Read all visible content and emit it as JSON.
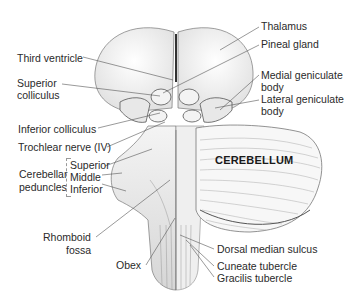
{
  "figure": {
    "region_label": "CEREBELLUM",
    "labels_left": [
      {
        "id": "third-ventricle",
        "text": "Third ventricle"
      },
      {
        "id": "superior-colliculus-1",
        "text": "Superior"
      },
      {
        "id": "superior-colliculus-2",
        "text": "colliculus"
      },
      {
        "id": "inferior-colliculus",
        "text": "Inferior colliculus"
      },
      {
        "id": "trochlear-nerve",
        "text": "Trochlear nerve (IV)"
      },
      {
        "id": "cerebellar-1",
        "text": "Cerebellar"
      },
      {
        "id": "cerebellar-2",
        "text": "peduncles"
      },
      {
        "id": "peduncle-superior",
        "text": "Superior"
      },
      {
        "id": "peduncle-middle",
        "text": "Middle"
      },
      {
        "id": "peduncle-inferior",
        "text": "Inferior"
      },
      {
        "id": "rhomboid-1",
        "text": "Rhomboid"
      },
      {
        "id": "rhomboid-2",
        "text": "fossa"
      },
      {
        "id": "obex",
        "text": "Obex"
      }
    ],
    "labels_right": [
      {
        "id": "thalamus",
        "text": "Thalamus"
      },
      {
        "id": "pineal-gland",
        "text": "Pineal gland"
      },
      {
        "id": "medial-geniculate-1",
        "text": "Medial geniculate"
      },
      {
        "id": "medial-geniculate-2",
        "text": "body"
      },
      {
        "id": "lateral-geniculate-1",
        "text": "Lateral geniculate"
      },
      {
        "id": "lateral-geniculate-2",
        "text": "body"
      },
      {
        "id": "dorsal-median-sulcus",
        "text": "Dorsal median sulcus"
      },
      {
        "id": "cuneate-tubercle",
        "text": "Cuneate tubercle"
      },
      {
        "id": "gracilis-tubercle",
        "text": "Gracilis tubercle"
      }
    ]
  }
}
